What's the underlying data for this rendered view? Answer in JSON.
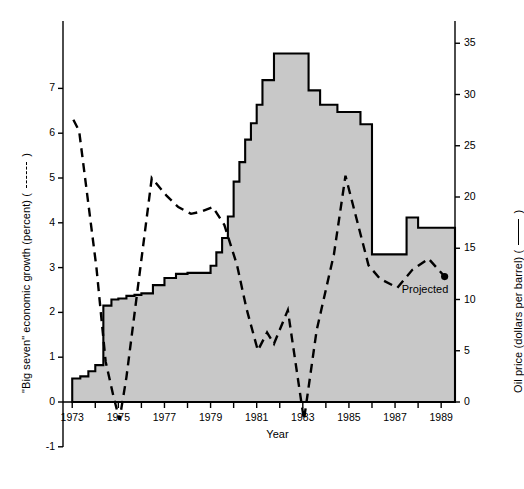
{
  "chart_data": {
    "type": "line",
    "title": "",
    "xlabel": "Year",
    "x_ticks": [
      1973,
      1975,
      1977,
      1979,
      1981,
      1983,
      1985,
      1987,
      1989
    ],
    "x_minor_ticks": [
      1974,
      1976,
      1978,
      1980,
      1982,
      1984,
      1986,
      1988
    ],
    "xlim": [
      1972.6,
      1989.6
    ],
    "grid": false,
    "legend_position": "axis-labels",
    "annotations": [
      {
        "text": "Projected",
        "x": 1988.3,
        "y_axis": "left",
        "y": 2.75
      }
    ],
    "axes": [
      {
        "id": "left",
        "label": "\"Big seven\" economic growth (percent)  ( — — — )",
        "ylabel": "\"Big seven\" economic growth (percent)",
        "legend_marker": "dashed",
        "ylim": [
          -1,
          8
        ],
        "ticks": [
          -1,
          0,
          1,
          2,
          3,
          4,
          5,
          6,
          7
        ],
        "tick_labels": [
          "-1",
          "0",
          "1",
          "2",
          "3",
          "4",
          "5",
          "6",
          "7"
        ]
      },
      {
        "id": "right",
        "label": "Oil price (dollars per barrel)  ( ——— )",
        "ylabel": "Oil price (dollars per barrel)",
        "legend_marker": "solid",
        "ylim": [
          0,
          40
        ],
        "ticks": [
          0,
          5,
          10,
          15,
          20,
          25,
          30,
          35
        ],
        "tick_labels": [
          "0",
          "5",
          "10",
          "15",
          "20",
          "25",
          "30",
          "35"
        ]
      }
    ],
    "series": [
      {
        "name": "\"Big seven\" economic growth (percent)",
        "axis": "left",
        "style": "dashed",
        "units": "percent",
        "end_marker": "dot",
        "x": [
          1973.05,
          1973.3,
          1974.05,
          1974.45,
          1974.8,
          1975.05,
          1975.35,
          1976.45,
          1977.1,
          1977.6,
          1978.15,
          1978.6,
          1979.1,
          1979.6,
          1980.15,
          1980.55,
          1981.05,
          1981.45,
          1981.75,
          1982.35,
          1983.05,
          1983.6,
          1984.35,
          1984.85,
          1985.35,
          1985.85,
          1986.35,
          1987.1,
          1987.75,
          1988.45,
          1989.15
        ],
        "y": [
          6.3,
          6.05,
          3.0,
          0.9,
          0.1,
          -0.4,
          0.55,
          5.0,
          4.6,
          4.35,
          4.2,
          4.25,
          4.35,
          3.95,
          3.05,
          2.1,
          1.15,
          1.55,
          1.3,
          2.05,
          -0.4,
          1.6,
          3.3,
          5.05,
          4.05,
          3.05,
          2.75,
          2.55,
          2.95,
          3.2,
          2.8
        ]
      },
      {
        "name": "Oil price (dollars per barrel)",
        "axis": "right",
        "style": "solid-step-area",
        "units": "dollars per barrel",
        "fill": "#c8c8c8",
        "steps_x": [
          1973.0,
          1973.35,
          1973.7,
          1974.0,
          1974.35,
          1974.7,
          1975.0,
          1975.35,
          1975.7,
          1976.0,
          1976.5,
          1977.0,
          1977.5,
          1978.0,
          1978.5,
          1979.0,
          1979.25,
          1979.5,
          1979.75,
          1980.0,
          1980.25,
          1980.5,
          1980.75,
          1981.0,
          1981.25,
          1981.75,
          1982.5,
          1983.25,
          1983.75,
          1984.5,
          1985.5,
          1986.0,
          1986.75,
          1987.5,
          1988.0,
          1989.6
        ],
        "steps_y": [
          2.3,
          2.5,
          3.0,
          3.6,
          9.4,
          10.0,
          10.1,
          10.35,
          10.45,
          10.6,
          11.4,
          12.1,
          12.5,
          12.6,
          12.6,
          13.3,
          14.6,
          16.0,
          18.1,
          21.5,
          23.4,
          25.6,
          27.2,
          29.0,
          31.4,
          34.0,
          34.0,
          30.4,
          29.0,
          28.3,
          27.1,
          14.4,
          14.4,
          18.0,
          17.0,
          17.0
        ]
      }
    ]
  },
  "axis_titles": {
    "x": "Year",
    "left": "\"Big seven\" economic growth (percent)  (",
    "left_suffix": ")",
    "right": "Oil price (dollars per barrel)  (",
    "right_suffix": ")"
  },
  "labels": {
    "projected": "Projected"
  },
  "colors": {
    "area_fill": "#c8c8c8",
    "line": "#000000",
    "axis": "#000000"
  }
}
